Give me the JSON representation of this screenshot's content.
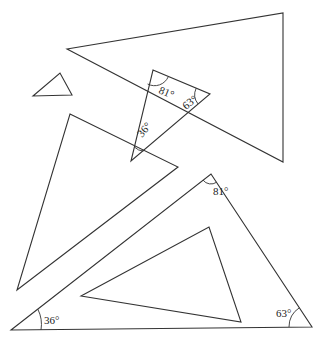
{
  "diagram": {
    "stroke_color": "#333333",
    "background": "#ffffff",
    "triangles": [
      {
        "id": "large-top",
        "points": "67,49 283,13 283,162",
        "labels": []
      },
      {
        "id": "small",
        "points": "33,96 60,73 72,95",
        "labels": []
      },
      {
        "id": "middle-labeled",
        "points": "153,70 210,94 131,161",
        "labels": [
          {
            "text": "81°",
            "x": 158,
            "y": 93,
            "rotate": 22
          },
          {
            "text": "63°",
            "x": 186,
            "y": 110,
            "rotate": -38
          },
          {
            "text": "36°",
            "x": 142,
            "y": 138,
            "rotate": -50
          }
        ]
      },
      {
        "id": "left-large",
        "points": "70,114 178,167 17,290",
        "labels": []
      },
      {
        "id": "bottom-large-labeled",
        "points": "11,330 211,174 312,327",
        "labels": [
          {
            "text": "81°",
            "x": 213,
            "y": 195,
            "rotate": 0
          },
          {
            "text": "36°",
            "x": 44,
            "y": 324,
            "rotate": 0
          },
          {
            "text": "63°",
            "x": 276,
            "y": 317,
            "rotate": 0
          }
        ]
      },
      {
        "id": "inner",
        "points": "81,296 209,227 241,322",
        "labels": []
      }
    ],
    "angle_arcs": [
      {
        "id": "mid-81",
        "d": "M 147.6 84 A 15 15 0 0 0 168.3 76.7"
      },
      {
        "id": "mid-63",
        "d": "M 196.2 88.2 A 15 15 0 0 0 198.0 103.9"
      },
      {
        "id": "mid-36",
        "d": "M 134.6 147.2 A 14 14 0 0 0 143.3 151.1"
      },
      {
        "id": "bot-81",
        "d": "M 203.1 180.2 A 10 10 0 0 0 216.5 182.3"
      },
      {
        "id": "bot-36",
        "d": "M 37.8 309.1 A 34 34 0 0 1 41 330"
      },
      {
        "id": "bot-63",
        "d": "M 289 327 A 23 23 0 0 1 299.3 307.8"
      }
    ]
  }
}
